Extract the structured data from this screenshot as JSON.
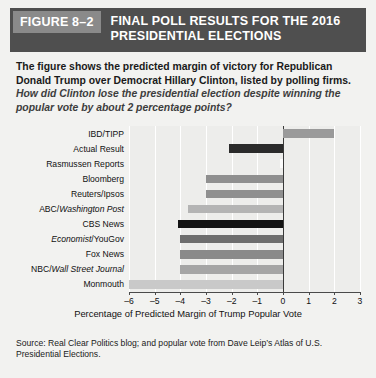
{
  "header": {
    "figure_tag": "FIGURE 8–2",
    "title": "FINAL POLL RESULTS FOR THE 2016\nPRESIDENTIAL ELECTIONS"
  },
  "description": {
    "bold_part": "The figure shows the predicted margin of victory for Republican Donald Trump over Democrat Hillary Clinton, listed by polling firms.",
    "italic_part": "How did Clinton lose the presidential election despite winning the popular vote by about 2 percentage points?"
  },
  "source": {
    "text": "Source: Real Clear Politics blog; and popular vote from Dave Leip’s Atlas of U.S. Presidential Elections."
  },
  "chart_data": {
    "type": "bar",
    "orientation": "horizontal",
    "title": "FINAL POLL RESULTS FOR THE 2016 PRESIDENTIAL ELECTIONS",
    "xlabel": "Percentage of Predicted Margin of Trump Popular Vote",
    "ylabel": "",
    "xlim": [
      -6,
      3
    ],
    "xticks": [
      -6,
      -5,
      -4,
      -3,
      -2,
      -1,
      0,
      1,
      2,
      3
    ],
    "xticklabels": [
      "–6",
      "–5",
      "–4",
      "–3",
      "–2",
      "–1",
      "0",
      "1",
      "2",
      "3"
    ],
    "grid": true,
    "legend": false,
    "categories": [
      "IBD/TIPP",
      "Actual Result",
      "Rasmussen Reports",
      "Bloomberg",
      "Reuters/Ipsos",
      "ABC/Washington Post",
      "CBS News",
      "Economist/YouGov",
      "Fox News",
      "NBC/Wall Street Journal",
      "Monmouth"
    ],
    "category_labels_html": [
      "IBD/TIPP",
      "Actual Result",
      "Rasmussen Reports",
      "Bloomberg",
      "Reuters/Ipsos",
      "ABC/<i>Washington Post</i>",
      "CBS News",
      "<i>Economist</i>/YouGov",
      "Fox News",
      "NBC/<i>Wall Street Journal</i>",
      "Monmouth"
    ],
    "values": [
      2.0,
      -2.1,
      -0.1,
      -3.0,
      -3.0,
      -3.7,
      -4.1,
      -4.0,
      -4.0,
      -4.0,
      -6.0
    ],
    "bar_colors": [
      "#9a9a9a",
      "#2b2b2b",
      "#fbfbfb",
      "#8f8f8f",
      "#8f8f8f",
      "#b4b4b4",
      "#141414",
      "#6e6e6e",
      "#8a8a8a",
      "#a5a5a5",
      "#c9c9c9"
    ]
  },
  "colors": {
    "header_bg": "#4f4f4f",
    "tag_bg": "#8a8a8a",
    "page_bg": "#f2f2f0",
    "plot_bg": "#ededeb",
    "gridline": "#ffffff",
    "axis": "#4a4a4a"
  }
}
